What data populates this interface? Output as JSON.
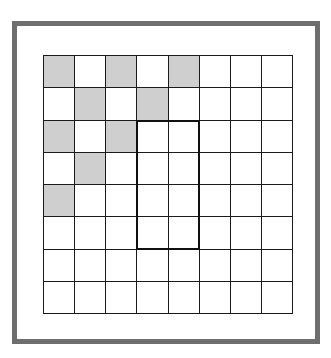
{
  "diagram": {
    "type": "grid",
    "rows": 8,
    "cols": 8,
    "colors": {
      "frame": "#6e6e6e",
      "grid_line": "#1a1a1a",
      "shaded": "#cfcfcf",
      "empty": "#ffffff",
      "highlight_border": "#111111"
    },
    "shaded_cells": [
      [
        0,
        0
      ],
      [
        0,
        2
      ],
      [
        0,
        4
      ],
      [
        1,
        1
      ],
      [
        1,
        3
      ],
      [
        2,
        0
      ],
      [
        2,
        2
      ],
      [
        3,
        1
      ],
      [
        4,
        0
      ]
    ],
    "highlight_rect": {
      "row_start": 2,
      "row_end": 5,
      "col_start": 3,
      "col_end": 4
    }
  }
}
